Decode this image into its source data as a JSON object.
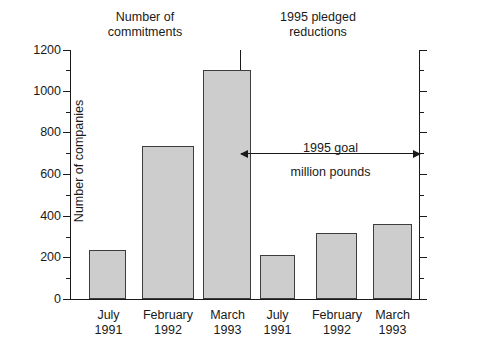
{
  "chart_data": {
    "type": "bar",
    "title": "",
    "panels": [
      {
        "title_line1": "Number of",
        "title_line2": "commitments",
        "categories": [
          {
            "line1": "July",
            "line2": "1991"
          },
          {
            "line1": "February",
            "line2": "1992"
          },
          {
            "line1": "March",
            "line2": "1993"
          }
        ],
        "values": [
          235,
          735,
          1100
        ],
        "axis": "left"
      },
      {
        "title_line1": "1995 pledged",
        "title_line2": "reductions",
        "categories": [
          {
            "line1": "July",
            "line2": "1991"
          },
          {
            "line1": "February",
            "line2": "1992"
          },
          {
            "line1": "March",
            "line2": "1993"
          }
        ],
        "values": [
          210,
          315,
          360
        ],
        "axis": "right"
      }
    ],
    "ylabel_left": "Number of companies",
    "ylabel_right": "Millions of pounds",
    "ylim": [
      0,
      1200
    ],
    "ytick_major": [
      0,
      200,
      400,
      600,
      800,
      1000,
      1200
    ],
    "ytick_minor": [
      100,
      300,
      500,
      700,
      900,
      1100
    ],
    "ytick_labels_left": [
      "0",
      "200",
      "400",
      "600",
      "800",
      "1000",
      "1200"
    ],
    "ytick_labels_right": [
      "0",
      "200",
      "400",
      "600",
      "800",
      "1000",
      "1200"
    ],
    "grid": false,
    "legend": "none",
    "annotations": [
      {
        "name": "1995-goal-arrow",
        "line1": "1995 goal",
        "line2": "million pounds",
        "value": 700,
        "style": "double-headed-arrow"
      }
    ],
    "colors": {
      "bar_fill": "#cdcdcd",
      "bar_edge": "#3d3d3d",
      "axis": "#1a1a1a",
      "background": "#ffffff"
    }
  }
}
